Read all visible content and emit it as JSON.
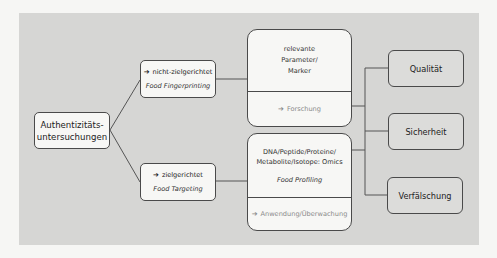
{
  "diagram": {
    "root": {
      "line1": "Authentizitäts-",
      "line2": "untersuchungen"
    },
    "branches": [
      {
        "arrow": "➔",
        "label": "nicht-zielgerichtet",
        "method": "Food Fingerprinting"
      },
      {
        "arrow": "➔",
        "label": "zielgerichtet",
        "method": "Food Targeting"
      }
    ],
    "details": [
      {
        "lines": [
          "relevante",
          "Parameter/",
          "Marker"
        ],
        "footer_arrow": "➔",
        "footer": "Forschung"
      },
      {
        "lines": [
          "DNA/Peptide/Proteine/",
          "Metabolite/Isotope: Omics"
        ],
        "method": "Food Profiling",
        "footer_arrow": "➔",
        "footer": "Anwendung/Überwachung"
      }
    ],
    "targets": [
      {
        "label": "Qualität"
      },
      {
        "label": "Sicherheit"
      },
      {
        "label": "Verfälschung"
      }
    ],
    "colors": {
      "panel": "#d6d6d4",
      "box_fill": "#f7f7f5",
      "target_fill": "#dcdcda",
      "border": "#4a4a4a",
      "muted_text": "#8a8a8a"
    }
  }
}
